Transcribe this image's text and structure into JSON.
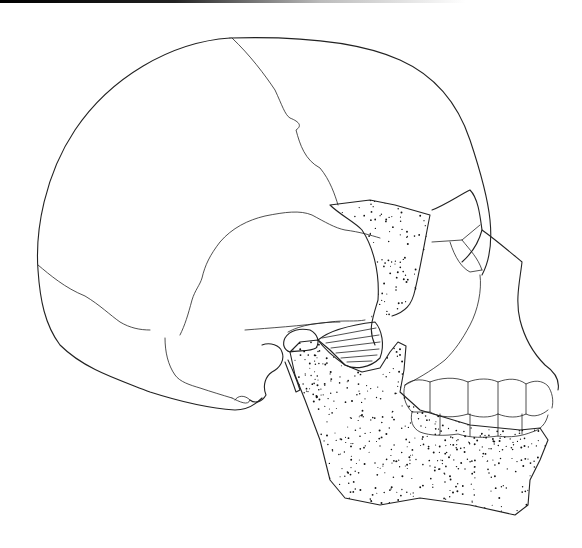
{
  "figure": {
    "description": "Lateral view line illustration of a human skull with stippled mandible, zygomatic arch and lateral pterygoid muscle",
    "structures": [
      "cranium",
      "coronal suture",
      "lambdoid suture",
      "temporal squama",
      "zygomatic arch",
      "orbit",
      "maxilla",
      "upper teeth",
      "lower teeth",
      "mandible",
      "temporomandibular joint",
      "lateral pterygoid muscle",
      "mastoid process",
      "styloid process"
    ]
  },
  "colors": {
    "stroke": "#222222",
    "stipple": "#111111",
    "background": "#ffffff"
  },
  "stipple": {
    "seed": 7,
    "mandible_dots": 1400,
    "arch_dots": 320
  }
}
